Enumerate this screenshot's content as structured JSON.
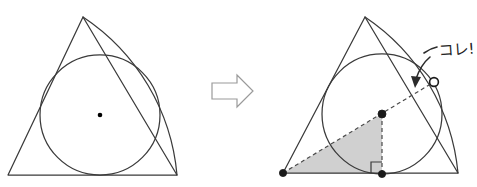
{
  "canvas": {
    "width": 477,
    "height": 187,
    "background": "#ffffff"
  },
  "annotation": {
    "callout_label": "コレ!",
    "callout_label_meaning": "this!",
    "callout_arrow_icon": "curved-arrow-icon"
  },
  "transition": {
    "arrow_icon": "right-arrow-icon",
    "arrow_label": ""
  },
  "figures": [
    {
      "id": "left-figure",
      "name": "triangle-with-incircle",
      "triangle": {
        "apex": [
          83,
          17
        ],
        "bottom_left": [
          8,
          175
        ],
        "bottom_right": [
          177,
          175
        ]
      },
      "bulge_arc": {
        "from": [
          83,
          17
        ],
        "to": [
          177,
          175
        ],
        "radius": 210
      },
      "circle": {
        "center": [
          100,
          115
        ],
        "radius": 60
      },
      "center_dot": {
        "position": [
          100,
          115
        ],
        "style": "filled",
        "radius": 2.2
      }
    },
    {
      "id": "right-figure",
      "name": "triangle-with-incircle-annotated",
      "triangle": {
        "apex": [
          365,
          17
        ],
        "bottom_left": [
          283,
          173
        ],
        "bottom_right": [
          458,
          173
        ]
      },
      "bulge_arc": {
        "from": [
          365,
          17
        ],
        "to": [
          458,
          173
        ],
        "radius": 210
      },
      "circle": {
        "center": [
          382,
          114
        ],
        "radius": 60
      },
      "center_dot": {
        "position": [
          382,
          114
        ],
        "style": "filled",
        "radius": 4.0
      },
      "vertex_dot": {
        "position": [
          283,
          173
        ],
        "style": "filled",
        "radius": 4.0
      },
      "foot_dot": {
        "position": [
          382,
          174
        ],
        "style": "filled",
        "radius": 4.0
      },
      "tangent_dot": {
        "position": [
          434,
          82
        ],
        "style": "open",
        "radius": 4.6
      },
      "hypotenuse_dashed": {
        "from": [
          283,
          173
        ],
        "to": [
          434,
          82
        ]
      },
      "vertical_dashed": {
        "from": [
          382,
          114
        ],
        "to": [
          382,
          174
        ]
      },
      "shaded_triangle": {
        "points": [
          [
            283,
            173
          ],
          [
            382,
            114
          ],
          [
            382,
            174
          ]
        ],
        "fill": "#c9c9c9"
      },
      "right_angle_marker": {
        "corner": [
          382,
          174
        ],
        "size": 11
      }
    }
  ],
  "colors": {
    "stroke": "#3a3a3a",
    "shade": "#c9c9c9",
    "dot": "#1a1a1a",
    "arrow_outline": "#9a9a9a",
    "background": "#ffffff"
  }
}
